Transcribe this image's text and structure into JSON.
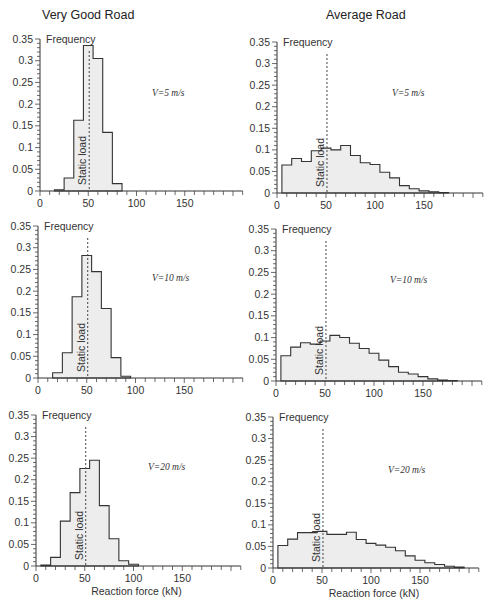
{
  "figure": {
    "columns": [
      "Very Good Road",
      "Average Road"
    ],
    "y_axis_title": "Frequency",
    "x_axis_title": "Reaction force (kN)",
    "static_load_label": "Static load",
    "static_load_kN": 51
  },
  "chart_data": [
    {
      "type": "bar",
      "title": "Very Good Road",
      "annotation": "V=5 m/s",
      "xlabel": "",
      "ylabel": "Frequency",
      "xlim": [
        0,
        210
      ],
      "ylim": [
        0,
        0.35
      ],
      "xticks": [
        0,
        50,
        100,
        150
      ],
      "yticks": [
        0,
        0.05,
        0.1,
        0.15,
        0.2,
        0.25,
        0.3,
        0.35
      ],
      "bin_width": 10,
      "bin_starts": [
        15,
        25,
        35,
        45,
        55,
        65,
        75
      ],
      "values": [
        0.003,
        0.03,
        0.163,
        0.335,
        0.305,
        0.135,
        0.017
      ],
      "static_load": 51
    },
    {
      "type": "bar",
      "title": "Average Road",
      "annotation": "V=5 m/s",
      "xlabel": "",
      "ylabel": "Frequency",
      "xlim": [
        0,
        210
      ],
      "ylim": [
        0,
        0.35
      ],
      "xticks": [
        0,
        50,
        100,
        150
      ],
      "yticks": [
        0,
        0.05,
        0.1,
        0.15,
        0.2,
        0.25,
        0.3,
        0.35
      ],
      "bin_width": 10,
      "bin_starts": [
        5,
        15,
        25,
        35,
        45,
        55,
        65,
        75,
        85,
        95,
        105,
        115,
        125,
        135,
        145,
        155,
        165
      ],
      "values": [
        0.065,
        0.08,
        0.073,
        0.098,
        0.104,
        0.1,
        0.11,
        0.087,
        0.07,
        0.066,
        0.048,
        0.035,
        0.017,
        0.01,
        0.005,
        0.003,
        0.001
      ],
      "static_load": 51
    },
    {
      "type": "bar",
      "title": "Very Good Road",
      "annotation": "V=10 m/s",
      "xlabel": "",
      "ylabel": "Frequency",
      "xlim": [
        0,
        210
      ],
      "ylim": [
        0,
        0.35
      ],
      "xticks": [
        0,
        50,
        100,
        150
      ],
      "yticks": [
        0,
        0.05,
        0.1,
        0.15,
        0.2,
        0.25,
        0.3,
        0.35
      ],
      "bin_width": 10,
      "bin_starts": [
        15,
        25,
        35,
        45,
        55,
        65,
        75,
        85
      ],
      "values": [
        0.012,
        0.058,
        0.187,
        0.282,
        0.245,
        0.16,
        0.047,
        0.004
      ],
      "static_load": 51
    },
    {
      "type": "bar",
      "title": "Average Road",
      "annotation": "V=10 m/s",
      "xlabel": "",
      "ylabel": "Frequency",
      "xlim": [
        0,
        210
      ],
      "ylim": [
        0,
        0.35
      ],
      "xticks": [
        0,
        50,
        100,
        150
      ],
      "yticks": [
        0,
        0.05,
        0.1,
        0.15,
        0.2,
        0.25,
        0.3,
        0.35
      ],
      "bin_width": 10,
      "bin_starts": [
        5,
        15,
        25,
        35,
        45,
        55,
        65,
        75,
        85,
        95,
        105,
        115,
        125,
        135,
        145,
        155,
        165,
        175
      ],
      "values": [
        0.058,
        0.078,
        0.088,
        0.085,
        0.092,
        0.105,
        0.1,
        0.087,
        0.075,
        0.064,
        0.048,
        0.033,
        0.02,
        0.016,
        0.01,
        0.005,
        0.002,
        0.001
      ],
      "static_load": 51
    },
    {
      "type": "bar",
      "title": "Very Good Road",
      "annotation": "V=20 m/s",
      "xlabel": "Reaction force (kN)",
      "ylabel": "Frequency",
      "xlim": [
        0,
        210
      ],
      "ylim": [
        0,
        0.35
      ],
      "xticks": [
        0,
        50,
        100,
        150
      ],
      "yticks": [
        0,
        0.05,
        0.1,
        0.15,
        0.2,
        0.25,
        0.3,
        0.35
      ],
      "bin_width": 10,
      "bin_starts": [
        5,
        15,
        25,
        35,
        45,
        55,
        65,
        75,
        85,
        95
      ],
      "values": [
        0.002,
        0.02,
        0.104,
        0.17,
        0.226,
        0.245,
        0.14,
        0.063,
        0.012,
        0.004
      ],
      "static_load": 51
    },
    {
      "type": "bar",
      "title": "Average Road",
      "annotation": "V=20 m/s",
      "xlabel": "Reaction force (kN)",
      "ylabel": "Frequency",
      "xlim": [
        0,
        210
      ],
      "ylim": [
        0,
        0.35
      ],
      "xticks": [
        0,
        50,
        100,
        150
      ],
      "yticks": [
        0,
        0.05,
        0.1,
        0.15,
        0.2,
        0.25,
        0.3,
        0.35
      ],
      "bin_width": 10,
      "bin_starts": [
        5,
        15,
        25,
        35,
        45,
        55,
        65,
        75,
        85,
        95,
        105,
        115,
        125,
        135,
        145,
        155,
        165,
        175,
        185
      ],
      "values": [
        0.052,
        0.067,
        0.082,
        0.082,
        0.085,
        0.078,
        0.078,
        0.083,
        0.066,
        0.057,
        0.053,
        0.048,
        0.04,
        0.028,
        0.018,
        0.012,
        0.008,
        0.004,
        0.002
      ],
      "static_load": 51
    }
  ],
  "layout": {
    "panels": [
      {
        "x0": 40,
        "y0": 191,
        "ytop": 39,
        "xscale": 0.965,
        "ann_x": 152,
        "ann_y": 96
      },
      {
        "x0": 277,
        "y0": 193,
        "ytop": 42,
        "xscale": 0.98,
        "ann_x": 392,
        "ann_y": 96
      },
      {
        "x0": 38,
        "y0": 378,
        "ytop": 226,
        "xscale": 0.975,
        "ann_x": 152,
        "ann_y": 281
      },
      {
        "x0": 276,
        "y0": 381,
        "ytop": 229,
        "xscale": 0.98,
        "ann_x": 390,
        "ann_y": 283
      },
      {
        "x0": 36,
        "y0": 566,
        "ytop": 415,
        "xscale": 0.975,
        "ann_x": 148,
        "ann_y": 470
      },
      {
        "x0": 273,
        "y0": 568,
        "ytop": 417,
        "xscale": 0.98,
        "ann_x": 388,
        "ann_y": 473
      }
    ]
  }
}
